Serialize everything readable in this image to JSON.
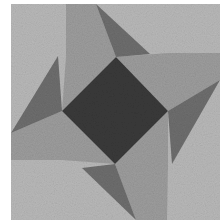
{
  "image": {
    "subject": "quilt-block",
    "description": "Pinwheel star quilt block with a dark center diamond, medium gray arms, and dark gray triangular points on a light speckled background"
  },
  "colors": {
    "page_background": "#ffffff",
    "light_background": "#b9b9b9",
    "medium_arm": "#9d9d9d",
    "dark_point": "#6e6e6e",
    "center_diamond": "#3a3a3a"
  },
  "geometry": {
    "block": {
      "x": 11,
      "y": 4,
      "w": 209,
      "h": 216
    },
    "center_diamond": [
      [
        116,
        57
      ],
      [
        168,
        111
      ],
      [
        115,
        164
      ],
      [
        62,
        111
      ]
    ],
    "arms": [
      [
        [
          66,
          4
        ],
        [
          96,
          4
        ],
        [
          116,
          57
        ],
        [
          62,
          111
        ],
        [
          66,
          57
        ]
      ],
      [
        [
          220,
          53
        ],
        [
          220,
          80
        ],
        [
          168,
          111
        ],
        [
          116,
          57
        ],
        [
          168,
          53
        ]
      ],
      [
        [
          167,
          220
        ],
        [
          136,
          220
        ],
        [
          115,
          164
        ],
        [
          168,
          111
        ],
        [
          168,
          164
        ]
      ],
      [
        [
          11,
          160
        ],
        [
          11,
          133
        ],
        [
          62,
          111
        ],
        [
          115,
          164
        ],
        [
          62,
          160
        ]
      ]
    ],
    "points": [
      [
        [
          96,
          4
        ],
        [
          150,
          54
        ],
        [
          116,
          57
        ]
      ],
      [
        [
          220,
          80
        ],
        [
          168,
          111
        ],
        [
          172,
          164
        ]
      ],
      [
        [
          136,
          220
        ],
        [
          115,
          164
        ],
        [
          82,
          168
        ]
      ],
      [
        [
          11,
          133
        ],
        [
          62,
          111
        ],
        [
          58,
          56
        ]
      ]
    ]
  }
}
